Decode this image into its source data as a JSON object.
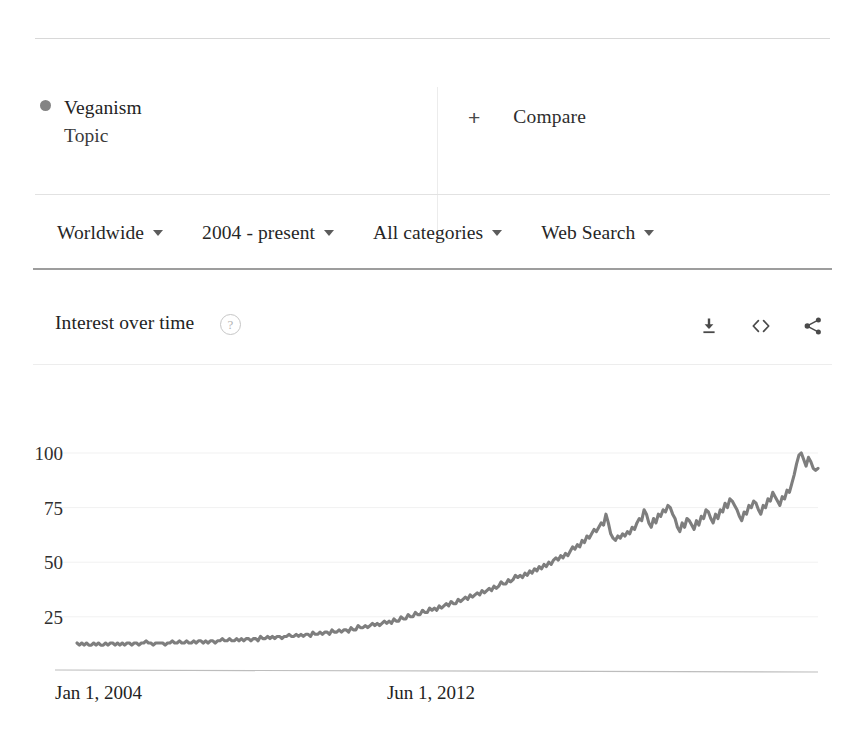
{
  "topic": {
    "name": "Veganism",
    "type_label": "Topic",
    "dot_color": "#848484"
  },
  "compare": {
    "plus": "+",
    "label": "Compare"
  },
  "filters": [
    {
      "label": "Worldwide",
      "name": "location"
    },
    {
      "label": "2004 - present",
      "name": "time-range"
    },
    {
      "label": "All categories",
      "name": "category"
    },
    {
      "label": "Web Search",
      "name": "search-type"
    }
  ],
  "section": {
    "title": "Interest over time",
    "help_glyph": "?",
    "actions": [
      {
        "name": "download-icon"
      },
      {
        "name": "embed-icon"
      },
      {
        "name": "share-icon"
      }
    ]
  },
  "chart_data": {
    "type": "line",
    "title": "Interest over time",
    "xlabel": "",
    "ylabel": "",
    "ylim": [
      0,
      105
    ],
    "yticks": [
      25,
      50,
      75,
      100
    ],
    "grid": true,
    "legend_position": "top-left",
    "line_color": "#7e7e7e",
    "series_name": "Veganism",
    "x_tick_labels": [
      "Jan 1, 2004",
      "Jun 1, 2012"
    ],
    "x_tick_positions": [
      0,
      0.51
    ],
    "x_start": "Jan 1, 2004",
    "x_end": "present",
    "values": [
      13,
      12,
      13,
      12,
      13,
      12,
      12,
      13,
      12,
      13,
      12,
      12,
      13,
      12,
      13,
      13,
      12,
      13,
      12,
      13,
      12,
      13,
      13,
      12,
      13,
      13,
      12,
      13,
      13,
      14,
      13,
      13,
      12,
      13,
      13,
      13,
      13,
      12,
      13,
      13,
      14,
      13,
      13,
      14,
      13,
      13,
      14,
      13,
      13,
      14,
      13,
      14,
      14,
      13,
      14,
      13,
      14,
      14,
      13,
      14,
      14,
      15,
      14,
      14,
      15,
      14,
      14,
      15,
      14,
      15,
      14,
      15,
      15,
      14,
      15,
      15,
      14,
      16,
      15,
      15,
      16,
      15,
      16,
      15,
      16,
      16,
      15,
      16,
      16,
      17,
      16,
      16,
      17,
      16,
      17,
      16,
      17,
      17,
      16,
      18,
      17,
      17,
      18,
      17,
      18,
      18,
      17,
      19,
      18,
      18,
      19,
      18,
      19,
      19,
      18,
      20,
      19,
      19,
      21,
      20,
      20,
      21,
      20,
      21,
      22,
      21,
      22,
      21,
      22,
      23,
      22,
      23,
      22,
      24,
      23,
      23,
      25,
      24,
      24,
      26,
      25,
      25,
      27,
      26,
      26,
      28,
      27,
      27,
      29,
      28,
      29,
      28,
      30,
      29,
      30,
      31,
      30,
      32,
      31,
      31,
      33,
      32,
      33,
      34,
      33,
      35,
      34,
      35,
      36,
      35,
      37,
      36,
      37,
      38,
      37,
      39,
      38,
      39,
      41,
      40,
      40,
      42,
      41,
      42,
      44,
      43,
      44,
      43,
      45,
      44,
      46,
      45,
      47,
      46,
      48,
      47,
      49,
      48,
      50,
      49,
      51,
      52,
      51,
      53,
      52,
      54,
      53,
      55,
      57,
      56,
      58,
      57,
      60,
      59,
      62,
      61,
      63,
      65,
      64,
      66,
      68,
      67,
      72,
      68,
      63,
      61,
      60,
      62,
      61,
      63,
      62,
      64,
      63,
      66,
      65,
      68,
      70,
      69,
      74,
      72,
      68,
      66,
      70,
      68,
      72,
      71,
      74,
      73,
      76,
      75,
      72,
      70,
      66,
      64,
      68,
      66,
      70,
      69,
      67,
      65,
      69,
      67,
      71,
      70,
      74,
      73,
      70,
      68,
      72,
      70,
      74,
      73,
      77,
      75,
      79,
      78,
      76,
      74,
      71,
      69,
      73,
      72,
      76,
      75,
      78,
      77,
      74,
      72,
      76,
      75,
      79,
      78,
      82,
      80,
      78,
      76,
      80,
      79,
      83,
      82,
      86,
      90,
      95,
      99,
      100,
      97,
      94,
      98,
      96,
      93,
      92,
      93
    ]
  }
}
